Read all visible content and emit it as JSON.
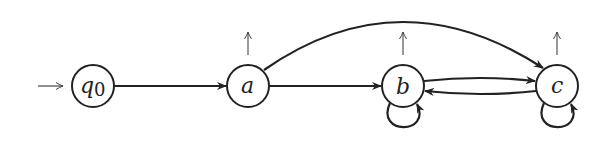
{
  "diagram": {
    "type": "automaton",
    "colors": {
      "stroke": "#222222",
      "background": "#ffffff"
    },
    "initial_marker": "→",
    "states": [
      {
        "id": "q0",
        "label": "q",
        "subscript": "0",
        "initial": true,
        "final_marker": false
      },
      {
        "id": "a",
        "label": "a",
        "initial": false,
        "final_marker": true
      },
      {
        "id": "b",
        "label": "b",
        "initial": false,
        "final_marker": true,
        "self_loop": true
      },
      {
        "id": "c",
        "label": "c",
        "initial": false,
        "final_marker": true,
        "self_loop": true
      }
    ],
    "final_marker": "↑",
    "transitions": [
      {
        "from": "q0",
        "to": "a"
      },
      {
        "from": "a",
        "to": "b"
      },
      {
        "from": "a",
        "to": "c",
        "curved": true
      },
      {
        "from": "b",
        "to": "c"
      },
      {
        "from": "c",
        "to": "b"
      },
      {
        "from": "b",
        "to": "b"
      },
      {
        "from": "c",
        "to": "c"
      }
    ]
  }
}
